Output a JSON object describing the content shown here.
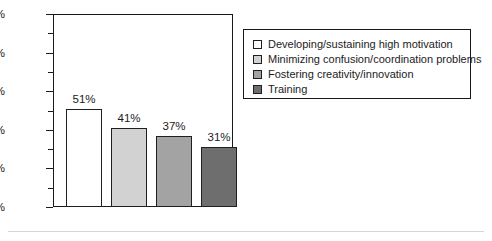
{
  "chart_data": {
    "type": "bar",
    "title": "",
    "subtitle": "",
    "xlabel": "",
    "ylabel": "",
    "ylim": [
      0,
      100
    ],
    "grid": false,
    "legend_position": "right",
    "categories": [
      "Developing/sustaining high motivation",
      "Minimizing confusion/coordination problems",
      "Fostering creativity/innovation",
      "Training"
    ],
    "values": [
      51,
      41,
      37,
      31
    ],
    "data_labels": [
      "51%",
      "41%",
      "37%",
      "31%"
    ],
    "colors": [
      "#ffffff",
      "#d2d2d2",
      "#a3a3a3",
      "#6e6e6e"
    ],
    "y_axis": {
      "major_ticks": [
        0,
        20,
        40,
        60,
        80,
        100
      ],
      "major_tick_labels": [
        "0%",
        "20%",
        "40%",
        "60%",
        "80%",
        "100%"
      ],
      "minor_ticks": [
        10,
        30,
        50,
        70,
        90
      ]
    }
  },
  "legend": {
    "entries": [
      {
        "label": "Developing/sustaining high motivation",
        "color": "#ffffff"
      },
      {
        "label": "Minimizing confusion/coordination problems",
        "color": "#d2d2d2"
      },
      {
        "label": "Fostering creativity/innovation",
        "color": "#a3a3a3"
      },
      {
        "label": "Training",
        "color": "#6e6e6e"
      }
    ]
  }
}
